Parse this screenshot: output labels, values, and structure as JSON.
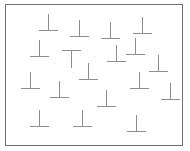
{
  "display": {
    "width": 190,
    "height": 151,
    "background_color": "#ffffff"
  },
  "frame": {
    "x": 5,
    "y": 4,
    "width": 178,
    "height": 142,
    "border_color": "#6f6f6f",
    "border_width": 1,
    "fill_color": "#ffffff"
  },
  "stimuli": {
    "line_color": "#8e8e8e",
    "line_width": 1,
    "target_type": "upright-T",
    "distractor_type": "inverted-T",
    "target_count": 1,
    "distractor_count": 18,
    "total_count": 19,
    "items": [
      {
        "name": "distractor-1",
        "type": "inverted-T",
        "x": 39,
        "y": 14,
        "width": 19,
        "height": 17,
        "rotation": 0
      },
      {
        "name": "distractor-2",
        "type": "inverted-T",
        "x": 70,
        "y": 20,
        "width": 19,
        "height": 17,
        "rotation": 0
      },
      {
        "name": "distractor-3",
        "type": "inverted-T",
        "x": 101,
        "y": 22,
        "width": 19,
        "height": 17,
        "rotation": 0
      },
      {
        "name": "distractor-4",
        "type": "inverted-T",
        "x": 133,
        "y": 17,
        "width": 19,
        "height": 17,
        "rotation": 0
      },
      {
        "name": "distractor-5",
        "type": "inverted-T",
        "x": 30,
        "y": 40,
        "width": 19,
        "height": 17,
        "rotation": 0
      },
      {
        "name": "target-upright-T",
        "type": "upright-T",
        "x": 62,
        "y": 50,
        "width": 19,
        "height": 18,
        "rotation": 0
      },
      {
        "name": "distractor-6",
        "type": "inverted-T",
        "x": 107,
        "y": 45,
        "width": 19,
        "height": 17,
        "rotation": 0
      },
      {
        "name": "distractor-7",
        "type": "inverted-T",
        "x": 126,
        "y": 38,
        "width": 19,
        "height": 17,
        "rotation": 0
      },
      {
        "name": "distractor-8",
        "type": "inverted-T",
        "x": 149,
        "y": 55,
        "width": 19,
        "height": 17,
        "rotation": 0
      },
      {
        "name": "distractor-9",
        "type": "inverted-T",
        "x": 79,
        "y": 63,
        "width": 19,
        "height": 17,
        "rotation": 0
      },
      {
        "name": "distractor-10",
        "type": "inverted-T",
        "x": 21,
        "y": 72,
        "width": 19,
        "height": 17,
        "rotation": 0
      },
      {
        "name": "distractor-11",
        "type": "inverted-T",
        "x": 50,
        "y": 81,
        "width": 19,
        "height": 17,
        "rotation": 0
      },
      {
        "name": "distractor-12",
        "type": "inverted-T",
        "x": 130,
        "y": 72,
        "width": 19,
        "height": 17,
        "rotation": 0
      },
      {
        "name": "distractor-13",
        "type": "inverted-T",
        "x": 161,
        "y": 83,
        "width": 19,
        "height": 17,
        "rotation": 0
      },
      {
        "name": "distractor-14",
        "type": "inverted-T",
        "x": 97,
        "y": 90,
        "width": 19,
        "height": 17,
        "rotation": 0
      },
      {
        "name": "distractor-15",
        "type": "inverted-T",
        "x": 30,
        "y": 110,
        "width": 19,
        "height": 17,
        "rotation": 0
      },
      {
        "name": "distractor-16",
        "type": "inverted-T",
        "x": 73,
        "y": 110,
        "width": 19,
        "height": 17,
        "rotation": 0
      },
      {
        "name": "distractor-17",
        "type": "inverted-T",
        "x": 127,
        "y": 115,
        "width": 19,
        "height": 17,
        "rotation": 0
      }
    ]
  }
}
